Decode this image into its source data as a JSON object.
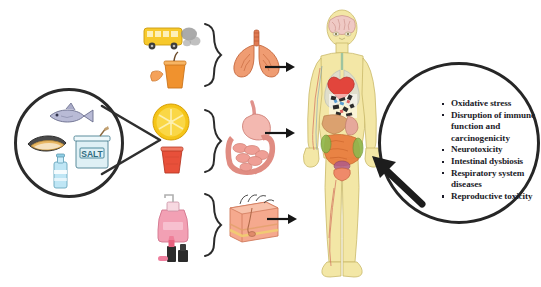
{
  "figure": {
    "type": "scientific-pathway-diagram"
  },
  "source_circle": {
    "name": "environmental-sources",
    "items": [
      {
        "icon": "fish-icon",
        "label": "Fish"
      },
      {
        "icon": "mussel-icon",
        "label": "Shellfish"
      },
      {
        "icon": "salt-jar-icon",
        "label": "SALT"
      },
      {
        "icon": "water-bottle-icon",
        "label": "Bottled water"
      }
    ],
    "salt_label": "SALT"
  },
  "routes": [
    {
      "id": "inhalation",
      "label": "Inhalation",
      "sources": [
        {
          "icon": "bus-exhaust-icon",
          "label": "Vehicle exhaust"
        },
        {
          "icon": "orange-drink-icon",
          "label": "Beverage"
        }
      ],
      "organ": {
        "icon": "lungs-icon",
        "label": "Lungs"
      }
    },
    {
      "id": "ingestion",
      "label": "Ingestion",
      "sources": [
        {
          "icon": "orange-slice-icon",
          "label": "Fruit"
        },
        {
          "icon": "red-cup-icon",
          "label": "Disposable cup"
        }
      ],
      "organ": {
        "icon": "digestive-tract-icon",
        "label": "Stomach and intestines"
      }
    },
    {
      "id": "dermal",
      "label": "Dermal contact",
      "sources": [
        {
          "icon": "lotion-pump-bottle-icon",
          "label": "Cosmetic lotion"
        },
        {
          "icon": "lipstick-icon",
          "label": "Lipstick"
        }
      ],
      "organ": {
        "icon": "skin-cross-section-icon",
        "label": "Skin"
      }
    }
  ],
  "body": {
    "name": "human-anatomy-figure",
    "label": "Human body"
  },
  "effects": {
    "name": "health-effects",
    "items": [
      "Oxidative stress",
      "Disruption of immune",
      "Neurotoxicity",
      "Intestinal dysbiosis",
      "Respiratory system",
      "Reproductive toxicity"
    ],
    "continuations": {
      "immune_2": "function and",
      "immune_3": "carcinogenicity",
      "respiratory_2": "diseases"
    }
  },
  "colors": {
    "outline": "#2b2b2b",
    "text": "#1b1b28",
    "bus": "#f5c518",
    "orange": "#f5b400",
    "cup_red": "#e8503a",
    "lungs": "#e8835c",
    "gut": "#e59a93",
    "skin": "#f0a58c",
    "body": "#f2e6a8",
    "pink": "#ef7f9e"
  }
}
